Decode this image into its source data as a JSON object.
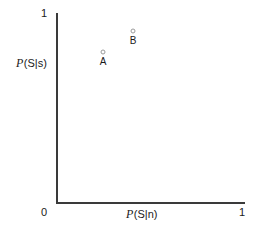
{
  "chart_data": {
    "type": "scatter",
    "title": "",
    "xlabel": "P(S|n)",
    "ylabel": "P(S|s)",
    "xlabel_parts": {
      "var": "P",
      "arg": "(S|n)"
    },
    "ylabel_parts": {
      "var": "P",
      "arg": "(S|s)"
    },
    "xlim": [
      0,
      1
    ],
    "ylim": [
      0,
      1
    ],
    "xticks": [
      "0",
      "1"
    ],
    "yticks": [
      "0",
      "1"
    ],
    "xtick_values": [
      0,
      1
    ],
    "ytick_values": [
      0,
      1
    ],
    "grid": false,
    "legend": null,
    "axis_style": "open-L-spines",
    "marker_style": "open-circle",
    "marker_color": "#9a9a9a",
    "axis_color": "#3a3a3a",
    "points": [
      {
        "label": "A",
        "x": 0.245,
        "y": 0.795
      },
      {
        "label": "B",
        "x": 0.405,
        "y": 0.905
      }
    ],
    "annotations": [
      {
        "text": "A",
        "position": "below-marker"
      },
      {
        "text": "B",
        "position": "below-marker"
      }
    ]
  },
  "axes": {
    "y_top_tick": "1",
    "origin_tick": "0",
    "x_right_tick": "1"
  }
}
